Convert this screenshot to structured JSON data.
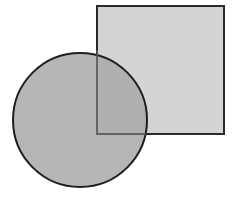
{
  "diagram": {
    "background": "#ffffff",
    "square": {
      "x": 97,
      "y": 6,
      "width": 127,
      "height": 128,
      "fill": "#d4d4d4",
      "stroke": "#2a2a2a"
    },
    "circle": {
      "cx": 80,
      "cy": 120,
      "r": 67,
      "fill": "#a9a9a9",
      "fill_opacity": 0.85,
      "stroke": "#1e1e1e"
    },
    "overlap_edge_color": "#555555"
  }
}
